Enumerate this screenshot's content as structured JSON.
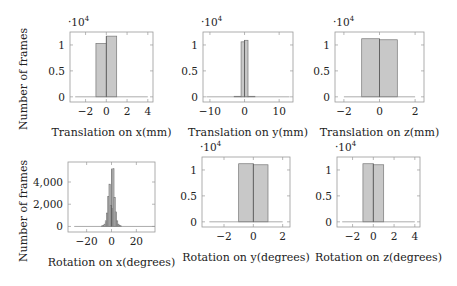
{
  "figure": {
    "ylabel_top": "Number of frames",
    "ylabel_bottom": "Number of frames"
  },
  "chart_data": [
    {
      "type": "bar",
      "title": "",
      "xlabel": "Translation on x(mm)",
      "ylabel": "Number of frames",
      "y_multiplier": "·10^4",
      "xlim": [
        -3.5,
        4.5
      ],
      "ylim": [
        -0.1,
        1.25
      ],
      "xticks": [
        -2,
        0,
        2,
        4
      ],
      "yticks": [
        0,
        0.5,
        1
      ],
      "bins": [
        {
          "x0": -1,
          "x1": 0,
          "value": 1.03
        },
        {
          "x0": 0,
          "x1": 1,
          "value": 1.17
        }
      ],
      "baseline_range": [
        -3,
        4
      ]
    },
    {
      "type": "bar",
      "title": "",
      "xlabel": "Translation on y(mm)",
      "ylabel": "",
      "y_multiplier": "·10^4",
      "xlim": [
        -12,
        14
      ],
      "ylim": [
        -0.1,
        1.25
      ],
      "xticks": [
        -10,
        0,
        10
      ],
      "yticks": [
        0,
        0.5,
        1
      ],
      "bins": [
        {
          "x0": -3,
          "x1": -1,
          "value": 0.01
        },
        {
          "x0": -1,
          "x1": 0,
          "value": 1.06
        },
        {
          "x0": 0,
          "x1": 1,
          "value": 1.09
        },
        {
          "x0": 1,
          "x1": 3,
          "value": 0.01
        }
      ],
      "baseline_range": [
        -11,
        13
      ]
    },
    {
      "type": "bar",
      "title": "",
      "xlabel": "Translation on z(mm)",
      "ylabel": "",
      "y_multiplier": "·10^4",
      "xlim": [
        -2.5,
        2.5
      ],
      "ylim": [
        -0.1,
        1.25
      ],
      "xticks": [
        -2,
        0,
        2
      ],
      "yticks": [
        0,
        0.5,
        1
      ],
      "bins": [
        {
          "x0": -1,
          "x1": 0,
          "value": 1.12
        },
        {
          "x0": 0,
          "x1": 1,
          "value": 1.1
        }
      ],
      "baseline_range": [
        -2,
        2
      ]
    },
    {
      "type": "bar",
      "title": "",
      "xlabel": "Rotation on x(degrees)",
      "ylabel": "Number of frames",
      "y_multiplier": "",
      "xlim": [
        -35,
        35
      ],
      "ylim": [
        -500,
        5800
      ],
      "xticks": [
        -20,
        0,
        20
      ],
      "yticks": [
        0,
        2000,
        4000
      ],
      "ytick_labels": [
        "0",
        "2,000",
        "4,000"
      ],
      "bins": [
        {
          "x0": -8,
          "x1": -7,
          "value": 40
        },
        {
          "x0": -7,
          "x1": -6,
          "value": 80
        },
        {
          "x0": -6,
          "x1": -5,
          "value": 200
        },
        {
          "x0": -5,
          "x1": -4,
          "value": 500
        },
        {
          "x0": -4,
          "x1": -3,
          "value": 1200
        },
        {
          "x0": -3,
          "x1": -2,
          "value": 2700
        },
        {
          "x0": -2,
          "x1": -1,
          "value": 3800
        },
        {
          "x0": -1,
          "x1": 0,
          "value": 1900
        },
        {
          "x0": 0,
          "x1": 1,
          "value": 1600
        },
        {
          "x0": 1,
          "x1": 2,
          "value": 5200
        },
        {
          "x0": 2,
          "x1": 3,
          "value": 2600
        },
        {
          "x0": 3,
          "x1": 4,
          "value": 1300
        },
        {
          "x0": 4,
          "x1": 5,
          "value": 500
        },
        {
          "x0": 5,
          "x1": 6,
          "value": 200
        },
        {
          "x0": 6,
          "x1": 7,
          "value": 80
        },
        {
          "x0": 7,
          "x1": 8,
          "value": 40
        }
      ],
      "baseline_range": [
        -30,
        35
      ]
    },
    {
      "type": "bar",
      "title": "",
      "xlabel": "Rotation on y(degrees)",
      "ylabel": "",
      "y_multiplier": "·10^4",
      "xlim": [
        -3.5,
        2.5
      ],
      "ylim": [
        -0.1,
        1.25
      ],
      "xticks": [
        -2,
        0,
        2
      ],
      "yticks": [
        0,
        0.5,
        1
      ],
      "bins": [
        {
          "x0": -1,
          "x1": 0,
          "value": 1.12
        },
        {
          "x0": 0,
          "x1": 1,
          "value": 1.1
        }
      ],
      "baseline_range": [
        -3,
        2
      ]
    },
    {
      "type": "bar",
      "title": "",
      "xlabel": "Rotation on z(degrees)",
      "ylabel": "",
      "y_multiplier": "·10^4",
      "xlim": [
        -3.5,
        4.5
      ],
      "ylim": [
        -0.1,
        1.25
      ],
      "xticks": [
        -2,
        0,
        2,
        4
      ],
      "yticks": [
        0,
        0.5,
        1
      ],
      "bins": [
        {
          "x0": -1,
          "x1": 0,
          "value": 1.12
        },
        {
          "x0": 0,
          "x1": 1,
          "value": 1.1
        }
      ],
      "baseline_range": [
        -3,
        4
      ]
    }
  ]
}
